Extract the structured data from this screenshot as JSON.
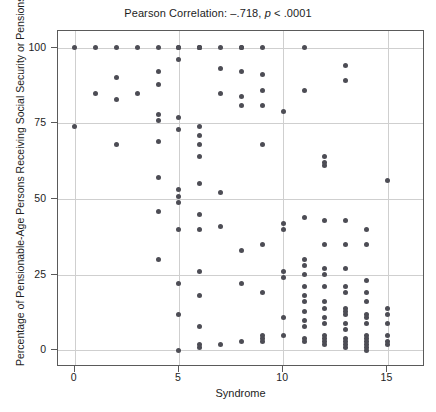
{
  "chart_data": {
    "type": "scatter",
    "title": "Pearson Correlation: –.718, p < .0001",
    "title_prefix": "Pearson Correlation: –.718, ",
    "title_italic": "p",
    "title_suffix": " < .0001",
    "xlabel": "Syndrome",
    "ylabel": "Percentage of Pensionable-Age Persons Receiving Social Security or Pensions",
    "xlim": [
      -0.8,
      16.8
    ],
    "ylim": [
      -5.5,
      105.5
    ],
    "xticks": [
      0,
      5,
      10,
      15
    ],
    "yticks": [
      0,
      25,
      50,
      75,
      100
    ],
    "xtick_labels": [
      "0",
      "5",
      "10",
      "15"
    ],
    "ytick_labels": [
      "0",
      "25",
      "50",
      "75",
      "100"
    ],
    "grid": true,
    "legend": "none",
    "marker_color": "#4d4d55",
    "grid_color": "#cfcfcf",
    "axis_color": "#5a5a5a",
    "correlation_r": -0.718,
    "p_value_text": "< .0001",
    "points": [
      [
        0,
        100
      ],
      [
        0,
        74
      ],
      [
        1,
        100
      ],
      [
        1,
        85
      ],
      [
        2,
        100
      ],
      [
        2,
        90
      ],
      [
        2,
        83
      ],
      [
        2,
        68
      ],
      [
        3,
        100
      ],
      [
        3,
        85
      ],
      [
        4,
        100
      ],
      [
        4,
        92
      ],
      [
        4,
        88
      ],
      [
        4,
        78
      ],
      [
        4,
        76
      ],
      [
        4,
        69
      ],
      [
        4,
        57
      ],
      [
        4,
        46
      ],
      [
        4,
        30
      ],
      [
        5,
        100
      ],
      [
        5,
        100
      ],
      [
        5,
        96
      ],
      [
        5,
        77
      ],
      [
        5,
        73
      ],
      [
        5,
        53
      ],
      [
        5,
        51
      ],
      [
        5,
        49
      ],
      [
        5,
        40
      ],
      [
        5,
        22
      ],
      [
        5,
        12
      ],
      [
        5,
        0
      ],
      [
        6,
        100
      ],
      [
        6,
        100
      ],
      [
        6,
        100
      ],
      [
        6,
        74
      ],
      [
        6,
        71
      ],
      [
        6,
        68
      ],
      [
        6,
        64
      ],
      [
        6,
        55
      ],
      [
        6,
        45
      ],
      [
        6,
        40
      ],
      [
        6,
        26
      ],
      [
        6,
        18
      ],
      [
        6,
        8
      ],
      [
        6,
        2
      ],
      [
        6,
        1
      ],
      [
        7,
        100
      ],
      [
        7,
        93
      ],
      [
        7,
        85
      ],
      [
        7,
        52
      ],
      [
        7,
        41
      ],
      [
        7,
        2
      ],
      [
        8,
        100
      ],
      [
        8,
        100
      ],
      [
        8,
        92
      ],
      [
        8,
        84
      ],
      [
        8,
        81
      ],
      [
        8,
        33
      ],
      [
        8,
        22
      ],
      [
        8,
        3
      ],
      [
        9,
        100
      ],
      [
        9,
        91
      ],
      [
        9,
        86
      ],
      [
        9,
        81
      ],
      [
        9,
        68
      ],
      [
        9,
        35
      ],
      [
        9,
        19
      ],
      [
        9,
        5
      ],
      [
        9,
        4
      ],
      [
        9,
        3
      ],
      [
        10,
        79
      ],
      [
        10,
        42
      ],
      [
        10,
        40
      ],
      [
        10,
        26
      ],
      [
        10,
        24
      ],
      [
        10,
        11
      ],
      [
        10,
        5
      ],
      [
        11,
        100
      ],
      [
        11,
        86
      ],
      [
        11,
        44
      ],
      [
        11,
        30
      ],
      [
        11,
        28
      ],
      [
        11,
        25
      ],
      [
        11,
        21
      ],
      [
        11,
        18
      ],
      [
        11,
        16
      ],
      [
        11,
        13
      ],
      [
        11,
        10
      ],
      [
        11,
        8
      ],
      [
        11,
        4
      ],
      [
        11,
        3
      ],
      [
        12,
        64
      ],
      [
        12,
        62
      ],
      [
        12,
        61
      ],
      [
        12,
        43
      ],
      [
        12,
        35
      ],
      [
        12,
        27
      ],
      [
        12,
        25
      ],
      [
        12,
        21
      ],
      [
        12,
        16
      ],
      [
        12,
        14
      ],
      [
        12,
        11
      ],
      [
        12,
        9
      ],
      [
        12,
        5
      ],
      [
        12,
        4
      ],
      [
        12,
        3
      ],
      [
        12,
        2
      ],
      [
        13,
        94
      ],
      [
        13,
        89
      ],
      [
        13,
        43
      ],
      [
        13,
        35
      ],
      [
        13,
        27
      ],
      [
        13,
        21
      ],
      [
        13,
        19
      ],
      [
        13,
        14
      ],
      [
        13,
        13
      ],
      [
        13,
        12
      ],
      [
        13,
        9
      ],
      [
        13,
        7
      ],
      [
        13,
        4
      ],
      [
        13,
        3
      ],
      [
        13,
        2
      ],
      [
        13,
        1
      ],
      [
        14,
        40
      ],
      [
        14,
        35
      ],
      [
        14,
        23
      ],
      [
        14,
        19
      ],
      [
        14,
        16
      ],
      [
        14,
        12
      ],
      [
        14,
        11
      ],
      [
        14,
        9
      ],
      [
        14,
        5
      ],
      [
        14,
        4
      ],
      [
        14,
        3
      ],
      [
        14,
        2
      ],
      [
        14,
        1
      ],
      [
        14,
        0
      ],
      [
        15,
        56
      ],
      [
        15,
        14
      ],
      [
        15,
        12
      ],
      [
        15,
        9
      ],
      [
        15,
        5
      ],
      [
        15,
        3
      ],
      [
        15,
        2
      ]
    ]
  }
}
